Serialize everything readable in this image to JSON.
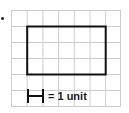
{
  "diagram": {
    "grid": {
      "columns": 7,
      "rows": 6,
      "line_color": "#cccccc"
    },
    "rectangle": {
      "col_start": 1,
      "row_start": 1,
      "width_units": 5,
      "height_units": 3,
      "stroke": "#111111"
    },
    "legend": {
      "label": "= 1 unit"
    }
  }
}
